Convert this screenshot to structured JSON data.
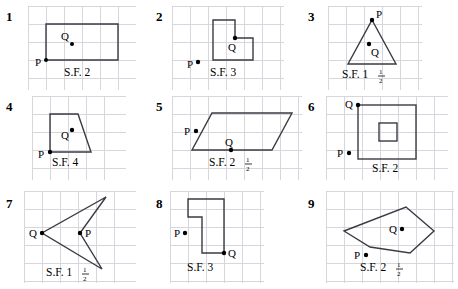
{
  "worksheet": {
    "title": "Dilation scale factor exercises",
    "panel_count": 9
  },
  "problems": [
    {
      "number": "1",
      "shape_name": "rectangle",
      "scale_factor_text": "S.F. 2",
      "sf_prefix": "S.F. 2",
      "sf_whole": "",
      "sf_num": "",
      "sf_den": "",
      "point_p_label": "P",
      "point_q_label": "Q"
    },
    {
      "number": "2",
      "shape_name": "l-shape",
      "scale_factor_text": "S.F. 3",
      "sf_prefix": "S.F. 3",
      "sf_whole": "",
      "sf_num": "",
      "sf_den": "",
      "point_p_label": "P",
      "point_q_label": "Q"
    },
    {
      "number": "3",
      "shape_name": "triangle",
      "scale_factor_text": "S.F. 1 1/2",
      "sf_prefix": "S.F. ",
      "sf_whole": "1",
      "sf_num": "1",
      "sf_den": "2",
      "point_p_label": "P",
      "point_q_label": "Q"
    },
    {
      "number": "4",
      "shape_name": "trapezoid",
      "scale_factor_text": "S.F. 4",
      "sf_prefix": "S.F. 4",
      "sf_whole": "",
      "sf_num": "",
      "sf_den": "",
      "point_p_label": "P",
      "point_q_label": "Q"
    },
    {
      "number": "5",
      "shape_name": "parallelogram",
      "scale_factor_text": "S.F. 2 1/2",
      "sf_prefix": "S.F. ",
      "sf_whole": "2",
      "sf_num": "1",
      "sf_den": "2",
      "point_p_label": "P",
      "point_q_label": "Q"
    },
    {
      "number": "6",
      "shape_name": "square-with-inner-square",
      "scale_factor_text": "S.F. 2",
      "sf_prefix": "S.F. 2",
      "sf_whole": "",
      "sf_num": "",
      "sf_den": "",
      "point_p_label": "P",
      "point_q_label": "Q"
    },
    {
      "number": "7",
      "shape_name": "dart-arrowhead",
      "scale_factor_text": "S.F. 1 1/2",
      "sf_prefix": "S.F. ",
      "sf_whole": "1",
      "sf_num": "1",
      "sf_den": "2",
      "point_p_label": "P",
      "point_q_label": "Q"
    },
    {
      "number": "8",
      "shape_name": "l-shape-mirrored",
      "scale_factor_text": "S.F. 3",
      "sf_prefix": "S.F. 3",
      "sf_whole": "",
      "sf_num": "",
      "sf_den": "",
      "point_p_label": "P",
      "point_q_label": "Q"
    },
    {
      "number": "9",
      "shape_name": "pentagon",
      "scale_factor_text": "S.F. 2 1/2",
      "sf_prefix": "S.F. ",
      "sf_whole": "2",
      "sf_num": "1",
      "sf_den": "2",
      "point_p_label": "P",
      "point_q_label": "Q"
    }
  ],
  "colors": {
    "grid": "#d6d6dc",
    "shape_stroke": "#3a3a42",
    "text": "#000000",
    "background": "#ffffff"
  }
}
